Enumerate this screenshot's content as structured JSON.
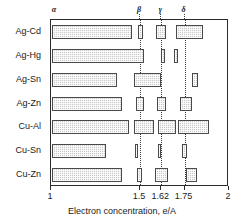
{
  "chart_data": {
    "type": "bar",
    "title": "",
    "xlabel": "Electron concentration, e/A",
    "ylabel": "",
    "xlim": [
      1,
      2
    ],
    "grid": false,
    "legend": null,
    "orientation": "horizontal",
    "phase_labels": [
      {
        "name": "alpha",
        "glyph": "α",
        "x": 1.0
      },
      {
        "name": "beta",
        "glyph": "β",
        "x": 1.5
      },
      {
        "name": "gamma",
        "glyph": "γ",
        "x": 1.62
      },
      {
        "name": "delta",
        "glyph": "δ",
        "x": 1.75
      }
    ],
    "phase_lines": [
      1.5,
      1.62,
      1.75
    ],
    "xticks": [
      1,
      1.5,
      1.62,
      1.75,
      2
    ],
    "xticklabels": [
      "1",
      "1.5",
      "1.62",
      "1.75",
      "2"
    ],
    "categories": [
      "Ag-Cd",
      "Ag-Hg",
      "Ag-Sn",
      "Ag-Zn",
      "Cu-Al",
      "Cu-Sn",
      "Cu-Zn"
    ],
    "series": [
      {
        "name": "Ag-Cd",
        "segments": [
          {
            "start": 1.005,
            "end": 1.455
          },
          {
            "start": 1.487,
            "end": 1.515
          },
          {
            "start": 1.592,
            "end": 1.648
          },
          {
            "start": 1.705,
            "end": 1.855
          }
        ]
      },
      {
        "name": "Ag-Hg",
        "segments": [
          {
            "start": 1.005,
            "end": 1.525
          },
          {
            "start": 1.618,
            "end": 1.638
          },
          {
            "start": 1.692,
            "end": 1.712
          }
        ]
      },
      {
        "name": "Ag-Sn",
        "segments": [
          {
            "start": 1.005,
            "end": 1.37
          },
          {
            "start": 1.465,
            "end": 1.62
          },
          {
            "start": 1.79,
            "end": 1.825
          }
        ]
      },
      {
        "name": "Ag-Zn",
        "segments": [
          {
            "start": 1.005,
            "end": 1.4
          },
          {
            "start": 1.48,
            "end": 1.525
          },
          {
            "start": 1.597,
            "end": 1.645
          },
          {
            "start": 1.722,
            "end": 1.79
          }
        ]
      },
      {
        "name": "Cu-Al",
        "segments": [
          {
            "start": 1.005,
            "end": 1.44
          },
          {
            "start": 1.468,
            "end": 1.58
          },
          {
            "start": 1.6,
            "end": 1.7
          },
          {
            "start": 1.715,
            "end": 1.885
          }
        ]
      },
      {
        "name": "Cu-Sn",
        "segments": [
          {
            "start": 1.005,
            "end": 1.31
          },
          {
            "start": 1.47,
            "end": 1.487
          },
          {
            "start": 1.602,
            "end": 1.62
          },
          {
            "start": 1.738,
            "end": 1.762
          }
        ]
      },
      {
        "name": "Cu-Zn",
        "segments": [
          {
            "start": 1.005,
            "end": 1.4
          },
          {
            "start": 1.482,
            "end": 1.51
          },
          {
            "start": 1.585,
            "end": 1.66
          },
          {
            "start": 1.76,
            "end": 1.818
          }
        ]
      }
    ]
  },
  "colors": {
    "bar_fill": "#c9c9c9",
    "bar_border": "#4a4a4a",
    "frame": "#2b2b2b",
    "text": "#1a1a1a",
    "phase_line": "#3a3a3a",
    "background": "#ffffff"
  }
}
